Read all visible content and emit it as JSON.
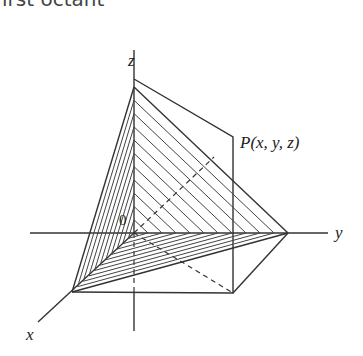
{
  "caption": "irst octant",
  "labels": {
    "z_axis": "z",
    "y_axis": "y",
    "x_axis": "x",
    "origin": "0",
    "point": "P(x, y, z)"
  },
  "geometry": {
    "origin": [
      134,
      233
    ],
    "z_top": [
      134,
      52
    ],
    "z_apex": [
      134,
      87
    ],
    "y_end": [
      328,
      233
    ],
    "y_apex": [
      288,
      233
    ],
    "x_end": [
      38,
      322
    ],
    "x_apex": [
      72,
      292
    ],
    "box_top_left": [
      134,
      79
    ],
    "box_top_right": [
      233,
      137
    ],
    "box_bottom_right": [
      233,
      293
    ],
    "hatch_count": 11
  },
  "colors": {
    "line": "#333333",
    "text": "#222222",
    "caption": "#444444"
  }
}
